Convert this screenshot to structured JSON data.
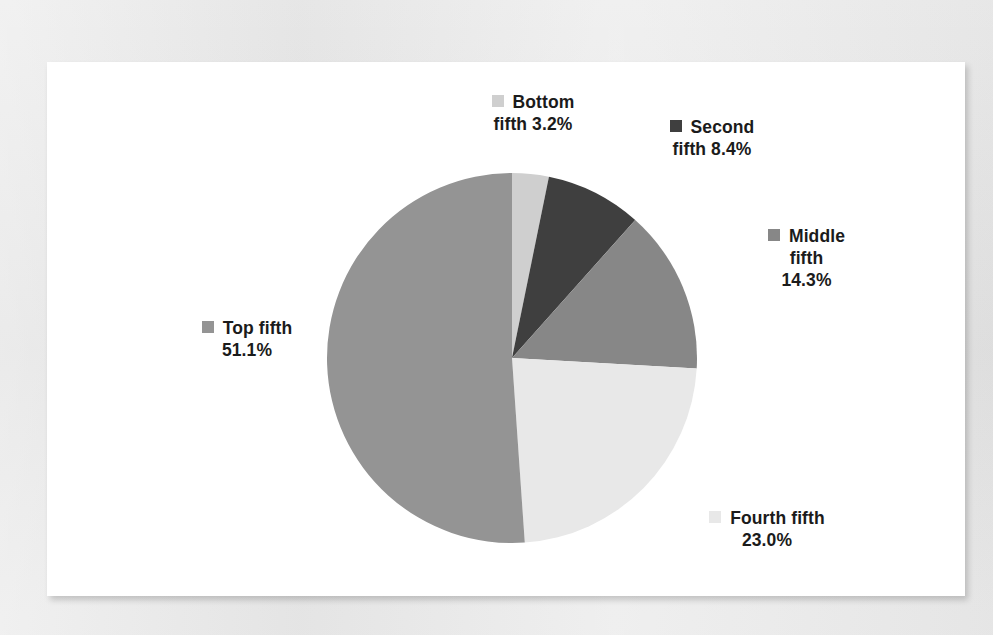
{
  "page": {
    "background_color": "#e3e3e3",
    "panel_color": "#ffffff"
  },
  "chart_data": {
    "type": "pie",
    "title": "",
    "subtitle": "",
    "xlabel": "",
    "ylabel": "",
    "legend_position": "outside-labels",
    "grid": false,
    "value_unit": "%",
    "start_angle_deg": 0,
    "direction": "clockwise",
    "categories": [
      "Bottom fifth",
      "Second fifth",
      "Middle fifth",
      "Fourth fifth",
      "Top fifth"
    ],
    "values": [
      3.2,
      8.4,
      14.3,
      23.0,
      51.1
    ],
    "colors": [
      "#cfcfcf",
      "#3f3f3f",
      "#878787",
      "#e8e8e8",
      "#949494"
    ],
    "slices": [
      {
        "name": "Bottom fifth",
        "value": 3.2,
        "value_text": "3.2%",
        "color": "#cfcfcf",
        "label_lines": [
          "Bottom",
          "fifth 3.2%"
        ],
        "swatch_name": "bottom-fifth-swatch"
      },
      {
        "name": "Second fifth",
        "value": 8.4,
        "value_text": "8.4%",
        "color": "#3f3f3f",
        "label_lines": [
          "Second",
          "fifth 8.4%"
        ],
        "swatch_name": "second-fifth-swatch"
      },
      {
        "name": "Middle fifth",
        "value": 14.3,
        "value_text": "14.3%",
        "color": "#878787",
        "label_lines": [
          "Middle",
          "fifth",
          "14.3%"
        ],
        "swatch_name": "middle-fifth-swatch"
      },
      {
        "name": "Fourth fifth",
        "value": 23.0,
        "value_text": "23.0%",
        "color": "#e8e8e8",
        "label_lines": [
          "Fourth fifth",
          "23.0%"
        ],
        "swatch_name": "fourth-fifth-swatch"
      },
      {
        "name": "Top fifth",
        "value": 51.1,
        "value_text": "51.1%",
        "color": "#949494",
        "label_lines": [
          "Top fifth",
          "51.1%"
        ],
        "swatch_name": "top-fifth-swatch"
      }
    ]
  },
  "labels": {
    "bottom_fifth": {
      "line1": "Bottom",
      "line2": "fifth 3.2%"
    },
    "second_fifth": {
      "line1": "Second",
      "line2": "fifth 8.4%"
    },
    "middle_fifth": {
      "line1": "Middle",
      "line2": "fifth",
      "line3": "14.3%"
    },
    "fourth_fifth": {
      "line1": "Fourth fifth",
      "line2": "23.0%"
    },
    "top_fifth": {
      "line1": "Top fifth",
      "line2": "51.1%"
    }
  }
}
